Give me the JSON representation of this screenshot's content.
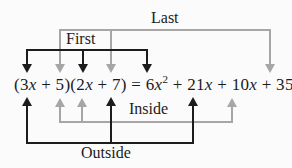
{
  "colors": {
    "black": "#1c1c1c",
    "gray": "#a6a6a6",
    "background": "#fbfbfb"
  },
  "equation": {
    "full_text": "(3x + 5)(2x + 7) = 6x² + 21x + 10x + 35",
    "parts": [
      {
        "t": "(3"
      },
      {
        "t": "x",
        "style": "italic"
      },
      {
        "t": " + 5)(2"
      },
      {
        "t": "x",
        "style": "italic"
      },
      {
        "t": " + 7) = 6"
      },
      {
        "t": "x",
        "style": "italic"
      },
      {
        "t": "2",
        "style": "superscript"
      },
      {
        "t": " + 21"
      },
      {
        "t": "x",
        "style": "italic"
      },
      {
        "t": " + 10"
      },
      {
        "t": "x",
        "style": "italic"
      },
      {
        "t": " + 35"
      }
    ]
  },
  "brackets": [
    {
      "id": "last",
      "label": "Last",
      "color": "gray",
      "position": "top",
      "connects": [
        "5",
        "7"
      ],
      "points_to": "35"
    },
    {
      "id": "first",
      "label": "First",
      "color": "black",
      "position": "top",
      "connects": [
        "3x",
        "2x"
      ],
      "points_to": "6x^2"
    },
    {
      "id": "inside",
      "label": "Inside",
      "color": "gray",
      "position": "bottom",
      "connects": [
        "5",
        "2x"
      ],
      "points_to": "10x"
    },
    {
      "id": "outside",
      "label": "Outside",
      "color": "black",
      "position": "bottom",
      "connects": [
        "3x",
        "7"
      ],
      "points_to": "21x"
    }
  ]
}
